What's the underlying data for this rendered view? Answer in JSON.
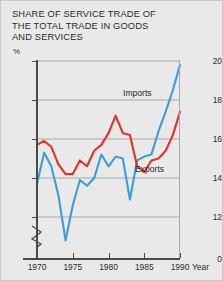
{
  "figure": {
    "title": "SHARE OF SERVICE TRADE OF\nTHE TOTAL TRADE IN GOODS\nAND SERVICES",
    "unit": "%",
    "background_color": "#e9e9e9",
    "border_color": "#c9c9c9"
  },
  "axes": {
    "y_label": "%",
    "y_ticks": [
      "0",
      "12",
      "14",
      "16",
      "18",
      "20"
    ],
    "x_ticks": [
      "1970",
      "1975",
      "1980",
      "1985",
      "1990"
    ],
    "x_name": "Year"
  },
  "labels": {
    "imports": "Imports",
    "exports": "Exports"
  },
  "colors": {
    "imports": "#3b9ed8",
    "exports": "#e43028",
    "grid": "#a9a9a9",
    "axis": "#4a4a4a",
    "text": "#2b2b2b"
  },
  "chart_data": {
    "type": "line",
    "title": "SHARE OF SERVICE TRADE OF THE TOTAL TRADE IN GOODS AND SERVICES",
    "xlabel": "Year",
    "ylabel": "%",
    "xlim": [
      1970,
      1990
    ],
    "ylim": [
      12,
      20
    ],
    "y_axis_break": true,
    "y_break_between": [
      0,
      12
    ],
    "grid": true,
    "legend": "inline-annotations",
    "x": [
      1970,
      1971,
      1972,
      1973,
      1974,
      1975,
      1976,
      1977,
      1978,
      1979,
      1980,
      1981,
      1982,
      1983,
      1984,
      1985,
      1986,
      1987,
      1988,
      1989,
      1990
    ],
    "series": [
      {
        "name": "Imports",
        "color": "#3b9ed8",
        "values": [
          13.7,
          15.3,
          14.6,
          13.1,
          10.8,
          12.6,
          13.9,
          13.6,
          14.0,
          15.2,
          14.6,
          15.1,
          15.0,
          12.9,
          14.9,
          15.1,
          15.2,
          16.4,
          17.4,
          18.5,
          19.8
        ]
      },
      {
        "name": "Exports",
        "color": "#e43028",
        "values": [
          15.7,
          15.9,
          15.6,
          14.7,
          14.2,
          14.2,
          14.9,
          14.6,
          15.4,
          15.7,
          16.3,
          17.2,
          16.3,
          16.2,
          14.6,
          14.3,
          14.9,
          15.0,
          15.4,
          16.2,
          17.4
        ]
      }
    ]
  }
}
